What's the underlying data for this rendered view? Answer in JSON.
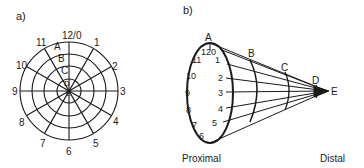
{
  "panel_a": {
    "label": "a)",
    "clock_labels": [
      "12/0",
      "1",
      "2",
      "3",
      "4",
      "5",
      "6",
      "7",
      "8",
      "9",
      "10",
      "11"
    ],
    "ring_labels": [
      "A",
      "B",
      "C",
      "D",
      "E"
    ]
  },
  "panel_b": {
    "label": "b)",
    "clock_labels": [
      "12",
      "0",
      "1",
      "2",
      "3",
      "4",
      "5",
      "6",
      "7",
      "8",
      "9",
      "10",
      "11"
    ],
    "section_labels": [
      "A",
      "B",
      "C",
      "D",
      "E"
    ],
    "proximal_label": "Proximal",
    "distal_label": "Distal"
  }
}
